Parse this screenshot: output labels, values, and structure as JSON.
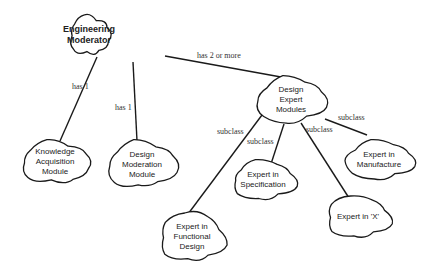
{
  "diagram": {
    "nodes": [
      {
        "id": "moderator",
        "label": "Engineering\nModerator",
        "bold": true,
        "x": 68,
        "y": 14,
        "w": 42,
        "h": 42,
        "bw": 42
      },
      {
        "id": "kam",
        "label": "Knowledge\nAcquisition\nModule",
        "x": 18,
        "y": 139,
        "w": 74,
        "h": 46
      },
      {
        "id": "dmm",
        "label": "Design\nModeration\nModule",
        "x": 104,
        "y": 139,
        "w": 76,
        "h": 52
      },
      {
        "id": "dem",
        "label": "Design\nExpert\nModules",
        "x": 253,
        "y": 75,
        "w": 76,
        "h": 50
      },
      {
        "id": "manufacture",
        "label": "Expert in\nManufacture",
        "x": 341,
        "y": 139,
        "w": 76,
        "h": 42
      },
      {
        "id": "specification",
        "label": "Expert in\nSpecification",
        "x": 227,
        "y": 159,
        "w": 72,
        "h": 42
      },
      {
        "id": "x",
        "label": "Expert in 'X'",
        "x": 322,
        "y": 195,
        "w": 72,
        "h": 44
      },
      {
        "id": "functional",
        "label": "Expert in\nFunctional\nDesign",
        "x": 155,
        "y": 211,
        "w": 74,
        "h": 52
      }
    ],
    "edges": [
      {
        "from": "moderator",
        "to": "kam",
        "label": "has 1",
        "x1": 97,
        "y1": 57,
        "x2": 60,
        "y2": 141,
        "lx": 72,
        "ly": 82
      },
      {
        "from": "moderator",
        "to": "dmm",
        "label": "has 1",
        "x1": 133,
        "y1": 62,
        "x2": 137,
        "y2": 141,
        "lx": 115,
        "ly": 103
      },
      {
        "from": "moderator",
        "to": "dem",
        "label": "has 2 or more",
        "x1": 165,
        "y1": 56,
        "x2": 281,
        "y2": 77,
        "lx": 197,
        "ly": 51
      },
      {
        "from": "dem",
        "to": "functional",
        "label": "subclass",
        "x1": 262,
        "y1": 115,
        "x2": 188,
        "y2": 214,
        "lx": 217,
        "ly": 127
      },
      {
        "from": "dem",
        "to": "specification",
        "label": "subclass",
        "x1": 284,
        "y1": 124,
        "x2": 270,
        "y2": 167,
        "lx": 247,
        "ly": 137
      },
      {
        "from": "dem",
        "to": "x",
        "label": "subclass",
        "x1": 301,
        "y1": 123,
        "x2": 349,
        "y2": 198,
        "lx": 306,
        "ly": 125
      },
      {
        "from": "dem",
        "to": "manufacture",
        "label": "subclass",
        "x1": 325,
        "y1": 119,
        "x2": 367,
        "y2": 135,
        "lx": 338,
        "ly": 113
      }
    ]
  },
  "colors": {
    "stroke": "#1a1a1a",
    "fill": "#ffffff",
    "text": "#222222"
  }
}
